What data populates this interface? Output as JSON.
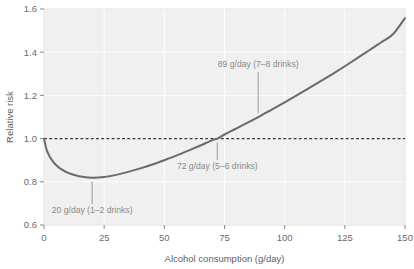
{
  "chart_data": {
    "type": "line",
    "title": "",
    "xlabel": "Alcohol consumption (g/day)",
    "ylabel": "Relative risk",
    "xlim": [
      0,
      150
    ],
    "ylim": [
      0.6,
      1.6
    ],
    "xticks": [
      "0",
      "25",
      "50",
      "75",
      "100",
      "125",
      "150"
    ],
    "xtick_values": [
      0,
      25,
      50,
      75,
      100,
      125,
      150
    ],
    "yticks": [
      "0.6",
      "0.8",
      "1.0",
      "1.2",
      "1.4",
      "1.6"
    ],
    "ytick_values": [
      0.6,
      0.8,
      1.0,
      1.2,
      1.4,
      1.6
    ],
    "grid": true,
    "legend": "none",
    "reference_line": {
      "orientation": "horizontal",
      "value": 1.0,
      "style": "dashed",
      "color": "#3a3a3a"
    },
    "series": [
      {
        "name": "Relative risk",
        "color": "#6a6a6a",
        "x": [
          0,
          1,
          2,
          3,
          5,
          7,
          10,
          13,
          16,
          20,
          25,
          30,
          35,
          40,
          45,
          50,
          55,
          60,
          65,
          70,
          72,
          75,
          80,
          85,
          89,
          95,
          100,
          105,
          110,
          115,
          120,
          125,
          130,
          135,
          140,
          145,
          150
        ],
        "y": [
          1.0,
          0.952,
          0.925,
          0.905,
          0.878,
          0.86,
          0.841,
          0.83,
          0.823,
          0.819,
          0.822,
          0.832,
          0.846,
          0.862,
          0.88,
          0.9,
          0.921,
          0.944,
          0.968,
          0.993,
          1.0,
          1.019,
          1.047,
          1.076,
          1.099,
          1.137,
          1.168,
          1.2,
          1.233,
          1.266,
          1.3,
          1.335,
          1.371,
          1.408,
          1.445,
          1.483,
          1.558
        ]
      }
    ],
    "annotations": [
      {
        "id": "annotation-20",
        "text": "20 g/day (1–2 drinks)",
        "point_x": 20,
        "point_y": 0.819,
        "label_x": 20,
        "label_y": 0.655,
        "leader": true
      },
      {
        "id": "annotation-72",
        "text": "72 g/day (5–6 drinks)",
        "point_x": 72,
        "point_y": 1.0,
        "label_x": 72,
        "label_y": 0.86,
        "leader": true
      },
      {
        "id": "annotation-89",
        "text": "89 g/day (7–8 drinks)",
        "point_x": 89,
        "point_y": 1.099,
        "label_x": 89,
        "label_y": 1.33,
        "leader": true
      }
    ]
  }
}
